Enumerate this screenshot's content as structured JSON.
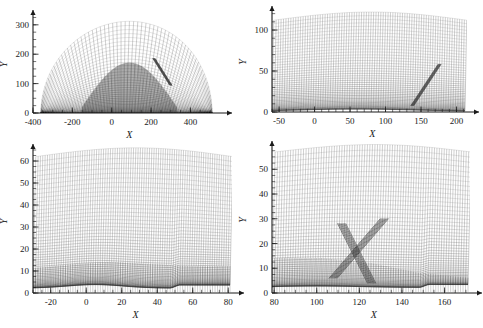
{
  "figure": {
    "kind": "computational-mesh-figure",
    "panel_count": 4,
    "background_color": "#ffffff",
    "mesh_color": "#202020",
    "axis_color": "#1a1a1a"
  },
  "chart_data": [
    {
      "type": "line",
      "panel": "top-left",
      "title": "",
      "subtitle": "",
      "xlabel": "X",
      "ylabel": "Y",
      "xlim": [
        -400,
        540
      ],
      "ylim": [
        0,
        330
      ],
      "xticks": [
        -400,
        -200,
        0,
        200,
        400
      ],
      "xtick_labels": [
        "-400",
        "-200",
        "0",
        "200",
        "400"
      ],
      "yticks": [
        0,
        100,
        200,
        300
      ],
      "ytick_labels": [
        "0",
        "100",
        "200",
        "300"
      ],
      "x_minor_tick_step": 50,
      "y_minor_tick_step": 25,
      "grid": false,
      "legend": "none",
      "annotations": [],
      "description": "Full-domain body-fitted curvilinear mesh forming a dome over a flat lower boundary; dense dark clustering near the body surface and an oblique discontinuity ray toward the right.",
      "domain": {
        "body_x_start": -360,
        "body_x_end": 510,
        "dome_apex_x": 90,
        "dome_apex_y": 312
      },
      "mesh": {
        "i_lines": 64,
        "j_lines": 40,
        "clustering": "wall-normal",
        "shock_ray": {
          "x0": 300,
          "y0": 95,
          "x1": 215,
          "y1": 185
        }
      },
      "series": [
        {
          "name": "dome-outer-boundary",
          "values": [
            0,
            312,
            0
          ]
        },
        {
          "name": "wall",
          "values": [
            0,
            0
          ]
        }
      ]
    },
    {
      "type": "line",
      "panel": "top-right",
      "title": "",
      "subtitle": "",
      "xlabel": "X",
      "ylabel": "Y",
      "xlim": [
        -60,
        212
      ],
      "ylim": [
        0,
        122
      ],
      "xticks": [
        -50,
        0,
        50,
        100,
        150,
        200
      ],
      "xtick_labels": [
        "-50",
        "0",
        "50",
        "100",
        "150",
        "200"
      ],
      "yticks": [
        0,
        50,
        100
      ],
      "ytick_labels": [
        "0",
        "50",
        "100"
      ],
      "x_minor_tick_step": 10,
      "y_minor_tick_step": 10,
      "grid": false,
      "legend": "none",
      "annotations": [],
      "description": "First zoom level: curvilinear mesh arching over the body, dark boundary-layer band hugging the wall from x=-40 to x=160, and a strong oblique shock ray rising from about (140,10) to (175,60).",
      "mesh": {
        "i_lines": 80,
        "j_lines": 46,
        "clustering": "wall-normal",
        "shock_ray": {
          "x0": 138,
          "y0": 8,
          "x1": 176,
          "y1": 58
        }
      },
      "series": [
        {
          "name": "outer-boundary",
          "values": [
            118,
            122,
            112
          ]
        },
        {
          "name": "wall",
          "values": [
            0,
            0
          ]
        }
      ]
    },
    {
      "type": "line",
      "panel": "bottom-left",
      "title": "",
      "subtitle": "",
      "xlabel": "X",
      "ylabel": "Y",
      "xlim": [
        -30,
        81
      ],
      "ylim": [
        0,
        65
      ],
      "xticks": [
        -20,
        0,
        20,
        40,
        60,
        80
      ],
      "xtick_labels": [
        "-20",
        "0",
        "20",
        "40",
        "60",
        "80"
      ],
      "yticks": [
        0,
        10,
        20,
        30,
        40,
        50,
        60
      ],
      "ytick_labels": [
        "0",
        "10",
        "20",
        "30",
        "40",
        "50",
        "60"
      ],
      "x_minor_tick_step": 5,
      "y_minor_tick_step": 2.5,
      "grid": false,
      "legend": "none",
      "annotations": [],
      "description": "Second zoom level on the forebody: smoothly curving quadrilateral cells, very dense dark cell clustering in the boundary layer below y=14, and a surface step near x=47.",
      "mesh": {
        "i_lines": 86,
        "j_lines": 52,
        "clustering": "wall-normal-strong",
        "surface_step_x": 47
      },
      "series": [
        {
          "name": "wall-profile",
          "values": [
            2,
            3,
            4,
            3,
            2,
            2
          ]
        },
        {
          "name": "boundary-layer-edge",
          "values": [
            11,
            13,
            14,
            13,
            12,
            12
          ]
        }
      ]
    },
    {
      "type": "line",
      "panel": "bottom-right",
      "title": "",
      "subtitle": "",
      "xlabel": "X",
      "ylabel": "Y",
      "xlim": [
        79,
        171
      ],
      "ylim": [
        0,
        59
      ],
      "xticks": [
        80,
        100,
        120,
        140,
        160
      ],
      "xtick_labels": [
        "80",
        "100",
        "120",
        "140",
        "160"
      ],
      "yticks": [
        0,
        10,
        20,
        30,
        40,
        50
      ],
      "ytick_labels": [
        "0",
        "10",
        "20",
        "30",
        "40",
        "50"
      ],
      "x_minor_tick_step": 5,
      "y_minor_tick_step": 2.5,
      "grid": false,
      "legend": "none",
      "annotations": [],
      "description": "Third zoom level on the aft body: an X-shaped shock/shear interaction centred near (118,15), a dark separated band along the wall from x=80 to x=115, and a surface step near x=148.",
      "mesh": {
        "i_lines": 78,
        "j_lines": 50,
        "clustering": "wall-normal-strong",
        "surface_step_x": 148,
        "shock_crossing": {
          "x": 118,
          "y": 15
        },
        "shock_ray_up": {
          "x0": 108,
          "y0": 6,
          "x1": 132,
          "y1": 30
        },
        "shock_ray_down": {
          "x0": 112,
          "y0": 28,
          "x1": 126,
          "y1": 4
        }
      },
      "series": [
        {
          "name": "wall-profile",
          "values": [
            2,
            2,
            2,
            2,
            3
          ]
        },
        {
          "name": "separation-band-edge",
          "values": [
            14,
            14,
            12,
            8,
            6
          ]
        }
      ]
    }
  ],
  "panels": [
    {
      "id": "top-left",
      "xlabel": "X",
      "ylabel": "Y"
    },
    {
      "id": "top-right",
      "xlabel": "X",
      "ylabel": "Y"
    },
    {
      "id": "bottom-left",
      "xlabel": "X",
      "ylabel": "Y"
    },
    {
      "id": "bottom-right",
      "xlabel": "X",
      "ylabel": "Y"
    }
  ]
}
